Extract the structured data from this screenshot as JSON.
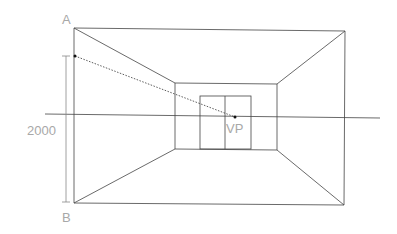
{
  "diagram": {
    "labels": {
      "top_point": "A",
      "bottom_point": "B",
      "dimension": "2000",
      "vanishing_point": "VP"
    },
    "colors": {
      "line": "#333333",
      "label": "#a8a8a8",
      "background": "#ffffff"
    }
  }
}
